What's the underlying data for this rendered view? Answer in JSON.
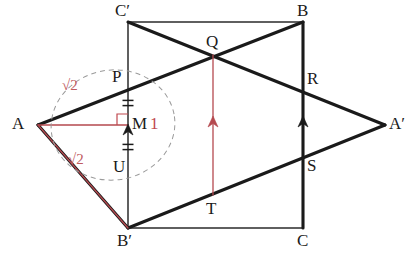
{
  "figure": {
    "colors": {
      "stroke_dark": "#1a1a1a",
      "stroke_thin": "#2b2b2b",
      "accent_red": "#c0484f",
      "accent_red_soft": "#b5494f",
      "dashed_gray": "#9a9a9a",
      "background": "#ffffff"
    },
    "vertices": [
      {
        "name": "A",
        "label": "A",
        "x": 38,
        "y": 125,
        "label_x": 12,
        "label_y": 115
      },
      {
        "name": "Aprime",
        "label": "A′",
        "x": 385,
        "y": 125,
        "label_x": 389,
        "label_y": 115
      },
      {
        "name": "B",
        "label": "B",
        "x": 303,
        "y": 22,
        "label_x": 297,
        "label_y": 2
      },
      {
        "name": "Bprime",
        "label": "B′",
        "x": 128,
        "y": 228,
        "label_x": 117,
        "label_y": 232
      },
      {
        "name": "C",
        "label": "C",
        "x": 303,
        "y": 228,
        "label_x": 297,
        "label_y": 232
      },
      {
        "name": "Cprime",
        "label": "C′",
        "x": 128,
        "y": 22,
        "label_x": 115,
        "label_y": 2
      },
      {
        "name": "P",
        "label": "P",
        "x": 128,
        "y": 88,
        "label_x": 112,
        "label_y": 68
      },
      {
        "name": "Q",
        "label": "Q",
        "x": 213,
        "y": 55,
        "label_x": 206,
        "label_y": 33
      },
      {
        "name": "R",
        "label": "R",
        "x": 303,
        "y": 85,
        "label_x": 307,
        "label_y": 70
      },
      {
        "name": "S",
        "label": "S",
        "x": 303,
        "y": 163,
        "label_x": 307,
        "label_y": 157
      },
      {
        "name": "T",
        "label": "T",
        "x": 213,
        "y": 195,
        "label_x": 206,
        "label_y": 200
      },
      {
        "name": "U",
        "label": "U",
        "x": 128,
        "y": 160,
        "label_x": 113,
        "label_y": 158
      },
      {
        "name": "M",
        "label": "M",
        "x": 128,
        "y": 125,
        "label_x": 132,
        "label_y": 115
      }
    ],
    "edges": [
      {
        "name": "edge-A-B",
        "from": "A",
        "to": "B",
        "weight": "thick",
        "color": "dark"
      },
      {
        "name": "edge-A-Bprime",
        "from": "A",
        "to": "Bprime",
        "weight": "thick",
        "color": "dark"
      },
      {
        "name": "edge-Cprime-Aprime",
        "from": "Cprime",
        "to": "Aprime",
        "weight": "thick",
        "color": "dark"
      },
      {
        "name": "edge-Bprime-Aprime",
        "from": "Bprime",
        "to": "Aprime",
        "weight": "thick",
        "color": "dark"
      },
      {
        "name": "edge-Cprime-B",
        "from": "Cprime",
        "to": "B",
        "weight": "thin",
        "color": "dark"
      },
      {
        "name": "edge-Bprime-C",
        "from": "Bprime",
        "to": "C",
        "weight": "thin",
        "color": "dark"
      },
      {
        "name": "edge-Cprime-Bprime",
        "from": "Cprime",
        "to": "Bprime",
        "weight": "thin",
        "color": "dark"
      },
      {
        "name": "edge-B-C",
        "from": "B",
        "to": "C",
        "weight": "thick",
        "color": "dark"
      }
    ],
    "red_segments": [
      {
        "name": "segment-A-M",
        "from": "A",
        "to": "M"
      },
      {
        "name": "segment-A-Bprime-red",
        "from": "A",
        "to": "Bprime"
      },
      {
        "name": "segment-Q-T-red",
        "from": "Q",
        "to": "T"
      }
    ],
    "arrows": [
      {
        "name": "arrow-on-PU",
        "x": 128,
        "y": 133,
        "color": "dark"
      },
      {
        "name": "arrow-on-QT",
        "x": 213,
        "y": 125,
        "color": "red"
      },
      {
        "name": "arrow-on-BC",
        "x": 303,
        "y": 125,
        "color": "dark"
      }
    ],
    "tick_marks": [
      {
        "name": "tick-PM-double",
        "x": 128,
        "y": 103
      },
      {
        "name": "tick-MU-double",
        "x": 128,
        "y": 147
      }
    ],
    "right_angle": {
      "name": "right-angle-at-M",
      "x": 128,
      "y": 125,
      "size": 11
    },
    "dashed_ellipse": {
      "name": "construction-ellipse",
      "cx": 113,
      "cy": 125,
      "rx": 62,
      "ry": 55,
      "rotation": -8
    },
    "annotations": [
      {
        "name": "label-sqrt2-upper",
        "text": "√2",
        "x": 62,
        "y": 78,
        "style": "red"
      },
      {
        "name": "label-sqrt2-lower",
        "text": "√2",
        "x": 68,
        "y": 152,
        "style": "red"
      },
      {
        "name": "label-one",
        "text": "1",
        "x": 150,
        "y": 115,
        "style": "num"
      }
    ]
  }
}
